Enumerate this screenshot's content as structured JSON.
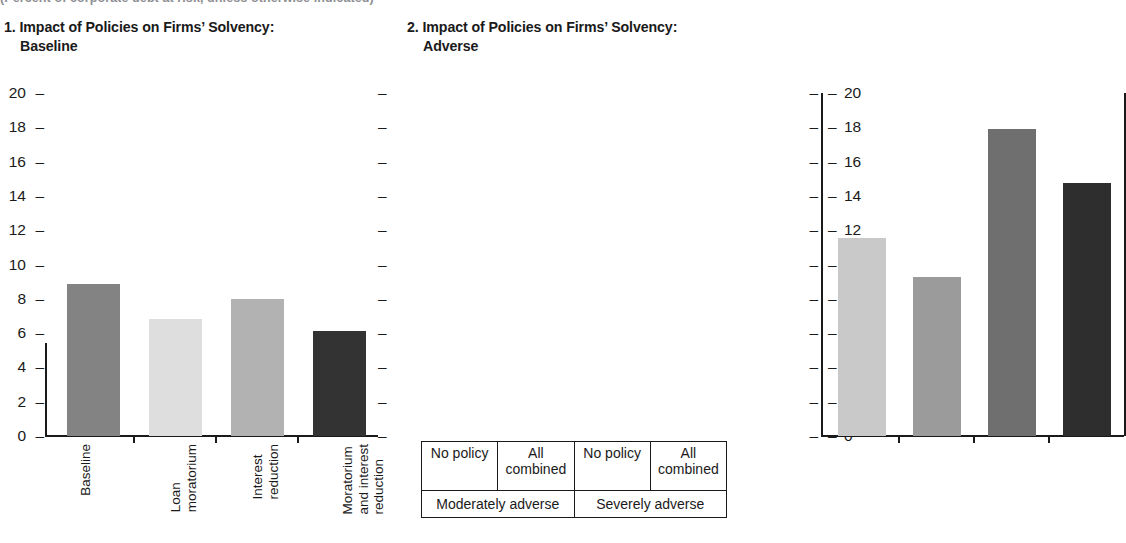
{
  "supertitle": "(Percent of corporate debt at risk, unless otherwise indicated)",
  "panels": [
    {
      "title_number": "1.",
      "title_main": "Impact of Policies on Firms’ Solvency:",
      "title_sub": "Baseline"
    },
    {
      "title_number": "2.",
      "title_main": "Impact of Policies on Firms’ Solvency:",
      "title_sub": "Adverse"
    }
  ],
  "axis": {
    "ticks": [
      "20",
      "18",
      "16",
      "14",
      "12",
      "10",
      "8",
      "6",
      "4",
      "2",
      "0"
    ],
    "tick_dash": "–"
  },
  "chart_data": [
    {
      "type": "bar",
      "title": "1. Impact of Policies on Firms’ Solvency: Baseline",
      "xlabel": "",
      "ylabel": "",
      "ylim": [
        0,
        20
      ],
      "ytick_values": [
        0,
        2,
        4,
        6,
        8,
        10,
        12,
        14,
        16,
        18,
        20
      ],
      "grid": false,
      "legend": "none",
      "categories": [
        "Baseline",
        "Loan moratorium",
        "Interest reduction",
        "Moratorium and interest reduction"
      ],
      "category_lines": [
        [
          "Baseline"
        ],
        [
          "Loan",
          "moratorium"
        ],
        [
          "Interest",
          "reduction"
        ],
        [
          "Moratorium",
          "and interest",
          "reduction"
        ]
      ],
      "values": [
        8.85,
        6.8,
        8.0,
        6.15
      ],
      "colors": [
        "#838383",
        "#dedede",
        "#b2b2b2",
        "#333333"
      ]
    },
    {
      "type": "bar",
      "title": "2. Impact of Policies on Firms’ Solvency: Adverse",
      "xlabel": "",
      "ylabel": "",
      "ylim": [
        0,
        20
      ],
      "ytick_values": [
        0,
        2,
        4,
        6,
        8,
        10,
        12,
        14,
        16,
        18,
        20
      ],
      "grid": false,
      "legend": "none",
      "categories": [
        "No policy",
        "All combined",
        "No policy",
        "All combined"
      ],
      "category_lines": [
        [
          "No policy"
        ],
        [
          "All",
          "combined"
        ],
        [
          "No policy"
        ],
        [
          "All",
          "combined"
        ]
      ],
      "groups": [
        {
          "label": "Moderately adverse",
          "span": 2
        },
        {
          "label": "Severely adverse",
          "span": 2
        }
      ],
      "values": [
        11.55,
        9.3,
        17.9,
        14.75
      ],
      "colors": [
        "#c9c9c9",
        "#9b9b9b",
        "#6f6f6f",
        "#2e2e2e"
      ]
    }
  ]
}
